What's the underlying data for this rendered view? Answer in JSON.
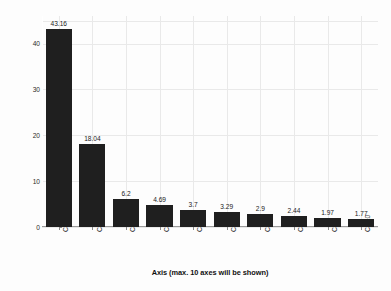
{
  "chart_data": {
    "type": "bar",
    "title": "",
    "subtitle": "",
    "xlabel": "Axis (max. 10 axes will be shown)",
    "ylabel": "Eigenvalue in percent of total inertia",
    "categories": [
      "CA1",
      "CA2",
      "CA3",
      "CA4",
      "CA5",
      "CA6",
      "CA7",
      "CA8",
      "CA9",
      "CA10"
    ],
    "values": [
      43.16,
      18.04,
      6.2,
      4.69,
      3.7,
      3.29,
      2.9,
      2.44,
      1.97,
      1.77
    ],
    "value_labels": [
      "43.16",
      "18.04",
      "6.2",
      "4.69",
      "3.7",
      "3.29",
      "2.9",
      "2.44",
      "1.97",
      "1.77"
    ],
    "ylim": [
      0,
      46
    ],
    "ytick_values": [
      0,
      10,
      20,
      30,
      40
    ],
    "ytick_labels": [
      "0",
      "10",
      "20",
      "30",
      "40"
    ],
    "grid": true,
    "legend": "none",
    "bar_color": "#1f1f1f",
    "grid_color": "#e9e9e9",
    "background_color": "#fdfdfd",
    "text_color": "#1a1a1a"
  }
}
